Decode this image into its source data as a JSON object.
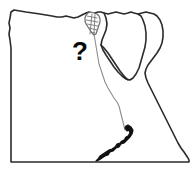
{
  "figure": {
    "kind": "outline-map",
    "background_color": "#ffffff"
  },
  "annotation": {
    "marker_label": "?",
    "marker_color": "#0a0a0a",
    "marker_x": 80,
    "marker_y": 60
  },
  "map": {
    "outline_color": "#2b2b2b",
    "fill_color": "#ffffff",
    "river_color": "#8d8d8d",
    "lake_color": "#111111",
    "delta_color": "#6e6e6e",
    "features": [
      {
        "name": "country-border",
        "label": "Egypt border"
      },
      {
        "name": "mediterranean-coast",
        "label": "Mediterranean coast"
      },
      {
        "name": "sinai-peninsula",
        "label": "Sinai Peninsula"
      },
      {
        "name": "gulf-of-suez",
        "label": "Gulf of Suez"
      },
      {
        "name": "gulf-of-aqaba",
        "label": "Gulf of Aqaba"
      },
      {
        "name": "red-sea-coast",
        "label": "Red Sea coast"
      },
      {
        "name": "nile-river",
        "label": "Nile River"
      },
      {
        "name": "nile-delta",
        "label": "Nile Delta"
      },
      {
        "name": "lake-nasser",
        "label": "Lake Nasser"
      }
    ],
    "paths": {
      "country_outline": "M 10 18 L 11 12 L 14 10 L 20 11 L 26 12 L 33 13 L 40 14 L 46 15 L 52 16 L 57 17 L 62 17 L 66 16 L 70 17 L 74 18 L 78 17 L 82 15 L 86 13 L 89 12 L 91 13 L 93 14 L 95 13 L 98 12 L 101 12 L 104 13 L 108 14 L 112 13 L 116 12 L 120 13 L 124 14 L 128 13 L 131 12 L 134 13 L 138 14 L 142 13 L 146 12 L 150 13 L 154 14 L 157 16 L 160 20 L 162 25 L 163 31 L 163 37 L 162 43 L 160 48 L 157 53 L 154 57 L 151 61 L 148 65 L 146 69 L 145 73 L 146 78 L 148 83 L 151 89 L 154 95 L 157 101 L 160 107 L 163 113 L 166 119 L 169 125 L 172 131 L 175 137 L 178 143 L 181 148 L 184 152 L 186 155 L 188 158 L 189 160 L 189 162 L 186 162 L 180 162 L 170 162 L 158 162 L 145 162 L 130 162 L 115 162 L 100 162 L 85 162 L 70 162 L 55 162 L 40 162 L 28 162 L 18 162 L 12 162 L 11 162 L 11 150 L 11 135 L 11 120 L 11 105 L 11 90 L 11 75 L 11 60 L 11 48 L 10 40 L 9 34 L 10 28 L 9 23 Z",
      "sinai": "M 104 13 L 106 18 L 107 24 L 106 30 L 104 35 L 102 40 L 101 45 L 103 50 L 106 55 L 110 61 L 114 67 L 118 72 L 122 76 L 126 79 L 130 80 L 133 78 L 136 74 L 139 68 L 141 61 L 143 54 L 145 47 L 146 40 L 146 33 L 145 26 L 143 20 L 141 16 L 138 14",
      "suez_gulf": "M 101 45 L 104 48 L 108 53 L 112 59 L 116 65 L 120 71 L 124 76 L 128 80",
      "nile": "M 93 22 L 93 28 L 94 34 L 95 40 L 96 46 L 97 52 L 98 58 L 99 64 L 101 70 L 103 76 L 105 82 L 108 88 L 111 93 L 114 98 L 117 102 L 119 106 L 120 110 L 121 114 L 122 118 L 123 122 L 124 126 L 125 130",
      "delta_outline": "M 88 13 L 86 15 L 85 18 L 85 21 L 86 24 L 88 27 L 90 30 L 92 33 L 94 35 L 96 34 L 97 31 L 98 28 L 99 25 L 100 22 L 100 19 L 99 16 L 97 14 L 94 13 L 91 12 Z",
      "delta_hatches": [
        "M 87 16 L 97 18",
        "M 86 20 L 98 22",
        "M 87 24 L 98 26",
        "M 89 28 L 97 30",
        "M 91 32 L 95 33",
        "M 92 14 L 90 34",
        "M 95 14 L 94 34"
      ],
      "lake_nasser": "M 125 128 L 127 131 L 129 130 L 130 133 L 128 136 L 126 137 L 124 140 L 122 141 L 120 143 L 117 144 L 115 147 L 112 149 L 109 150 L 106 152 L 103 154 L 100 156 L 98 159 L 96 161 L 99 160 L 102 158 L 105 156 L 108 155 L 110 152 L 113 151 L 116 148 L 119 147 L 121 144 L 124 143 L 127 140 L 130 137 L 132 134 L 133 130 L 131 127 L 128 125 L 126 126 Z"
    }
  }
}
